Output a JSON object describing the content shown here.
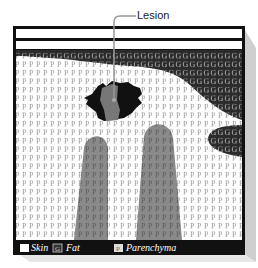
{
  "callout": {
    "label": "Lesion"
  },
  "legend": {
    "items": [
      {
        "key": "skin",
        "symbol": "",
        "label": "Skin",
        "color": "#ffffff"
      },
      {
        "key": "fat",
        "symbol": "G",
        "label": "Fat",
        "color": "#333333"
      },
      {
        "key": "parenchyma",
        "symbol": "P",
        "label": "Parenchyma",
        "color": "#dddddd"
      }
    ]
  },
  "colors": {
    "frame": "#111111",
    "fat": "#2b2b2b",
    "glandular": "#8a8a8a",
    "lesion_dark": "#111111",
    "lesion_mid": "#777777",
    "shadow": "#cfcfcf"
  }
}
